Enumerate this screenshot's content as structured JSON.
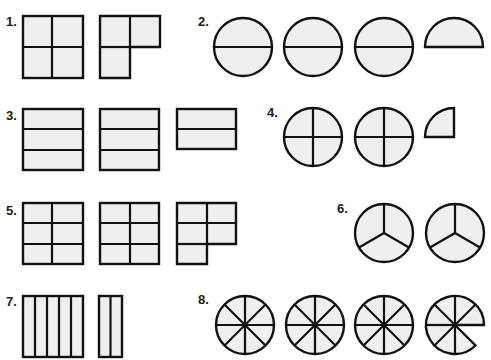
{
  "problems": [
    {
      "number": "1.",
      "label_pos": [
        6,
        14
      ],
      "description": "Squares divided into fourths: one whole (4/4) and 3 fourths"
    },
    {
      "number": "2.",
      "label_pos": [
        198,
        14
      ],
      "description": "Circles divided into halves: three whole circles and one half"
    },
    {
      "number": "3.",
      "label_pos": [
        6,
        108
      ],
      "description": "Rectangles divided into thirds: two whole and two thirds"
    },
    {
      "number": "4.",
      "label_pos": [
        266,
        106
      ],
      "description": "Circles divided into fourths: two whole and one fourth"
    },
    {
      "number": "5.",
      "label_pos": [
        6,
        203
      ],
      "description": "Squares divided into sixths: two whole and five sixths"
    },
    {
      "number": "6.",
      "label_pos": [
        337,
        201
      ],
      "description": "Circles divided into thirds: two whole circles"
    },
    {
      "number": "7.",
      "label_pos": [
        6,
        294
      ],
      "description": "Rectangle divided into fifths and a two-fifths piece"
    },
    {
      "number": "8.",
      "label_pos": [
        198,
        292
      ],
      "description": "Circles divided into eighths: three whole and seven eighths"
    }
  ],
  "colors": {
    "fill": "#efefef",
    "stroke": "#111111",
    "background": "#ffffff"
  }
}
